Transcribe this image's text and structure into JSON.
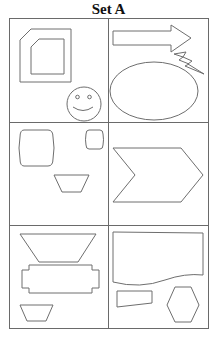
{
  "title": "Set A",
  "layout": {
    "rows": 3,
    "columns": 2
  },
  "colors": {
    "stroke": "#6e6e6e",
    "grid": "#6a6a6a",
    "background": "#ffffff",
    "title": "#111111"
  },
  "cells": [
    {
      "position": "row-1-col-1",
      "shapes": [
        "octagon-corner-cut-square-outer",
        "corner-cut-square-inner",
        "smiley-face"
      ]
    },
    {
      "position": "row-1-col-2",
      "shapes": [
        "right-arrow",
        "lightning-bolt",
        "ellipse"
      ]
    },
    {
      "position": "row-2-col-1",
      "shapes": [
        "large-barrel-rounded-rectangle",
        "small-barrel-rounded-rectangle",
        "trapezoid"
      ]
    },
    {
      "position": "row-2-col-2",
      "shapes": [
        "chevron"
      ]
    },
    {
      "position": "row-3-col-1",
      "shapes": [
        "inverted-trapezoid-large",
        "notched-rectangle",
        "inverted-trapezoid-small"
      ]
    },
    {
      "position": "row-3-col-2",
      "shapes": [
        "wavy-bottom-rectangle",
        "quadrilateral",
        "hexagon"
      ]
    }
  ]
}
